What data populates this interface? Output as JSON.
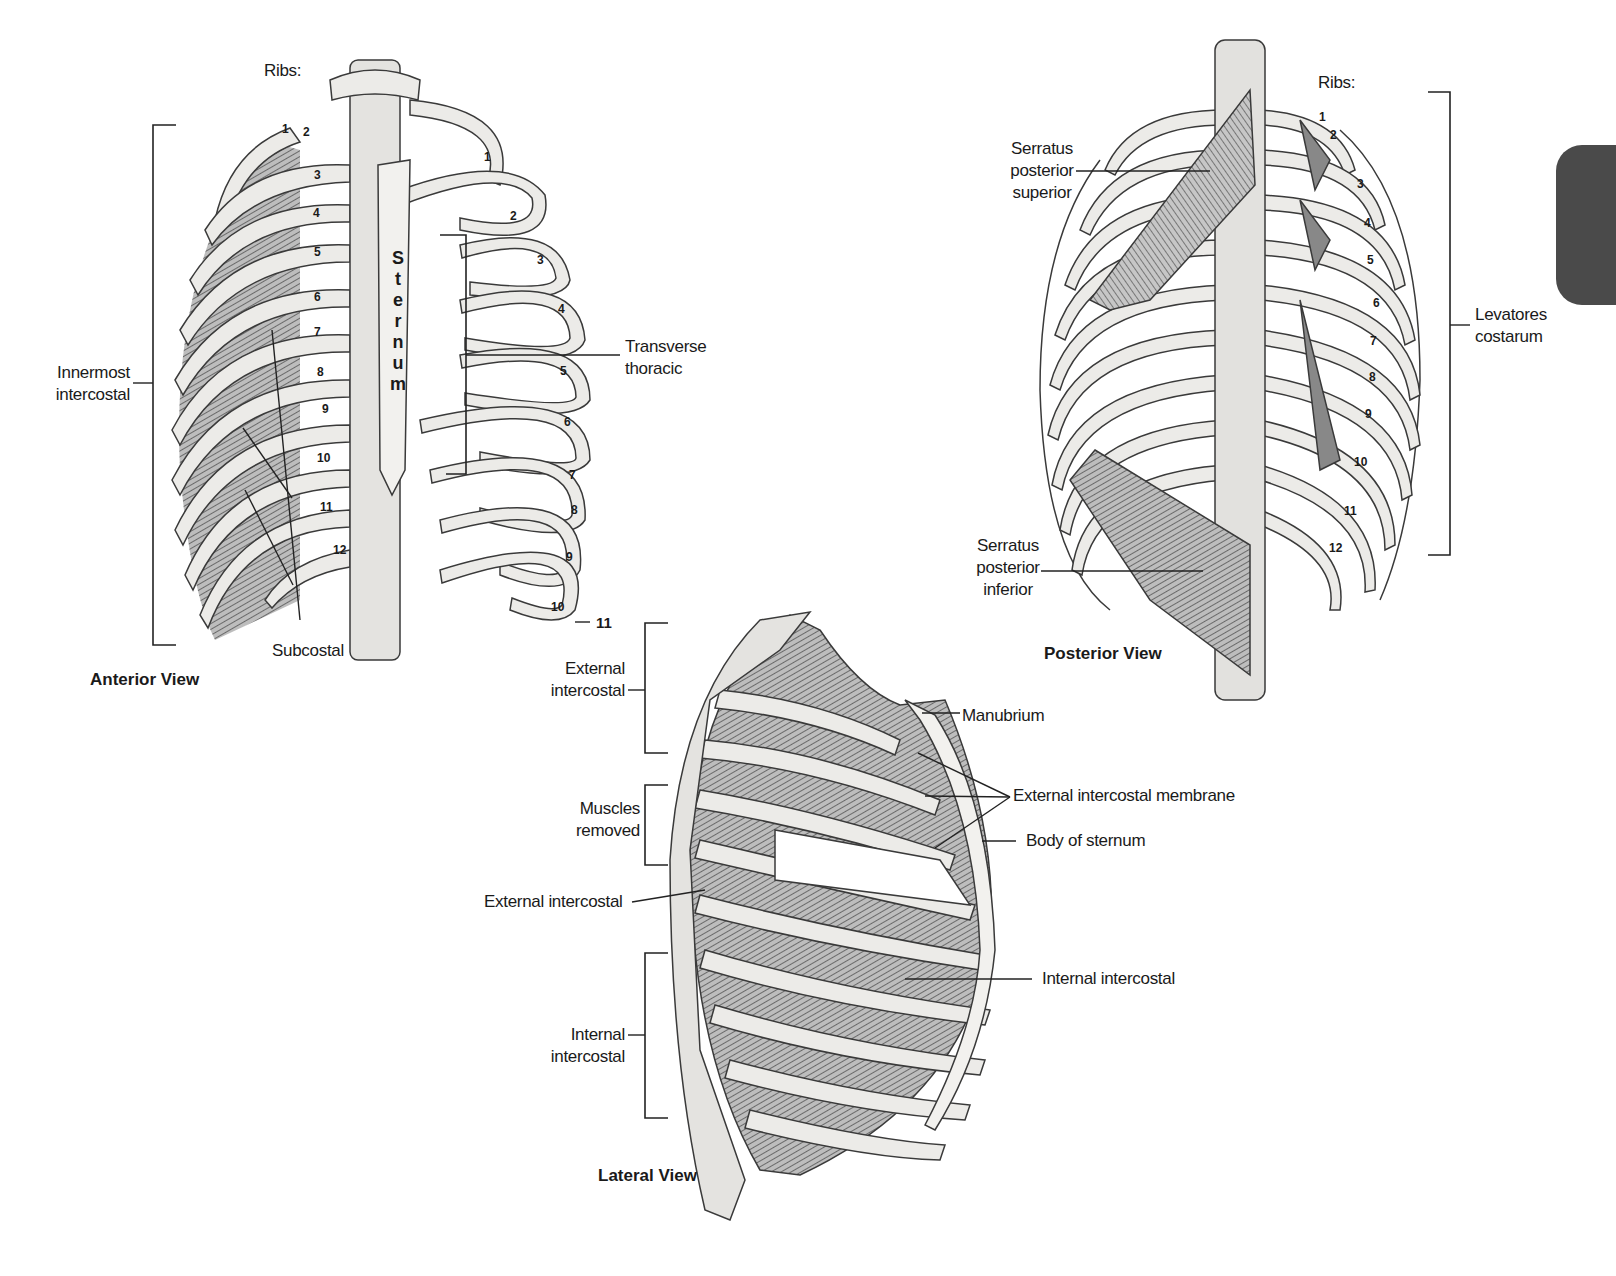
{
  "views": {
    "anterior": {
      "title": "Anterior View",
      "ribs_heading": "Ribs:",
      "sternum_label": "Sternum",
      "labels": {
        "innermost_intercostal": [
          "Innermost",
          "intercostal"
        ],
        "subcostal": "Subcostal",
        "transverse_thoracic": [
          "Transverse",
          "thoracic"
        ]
      },
      "rib_numbers_left": [
        "1",
        "2",
        "3",
        "4",
        "5",
        "6",
        "7",
        "8",
        "9",
        "10",
        "11",
        "12"
      ],
      "rib_numbers_right": [
        "1",
        "2",
        "3",
        "4",
        "5",
        "6",
        "7",
        "8",
        "9",
        "10",
        "11"
      ]
    },
    "posterior": {
      "title": "Posterior View",
      "ribs_heading": "Ribs:",
      "labels": {
        "serratus_posterior_superior": [
          "Serratus",
          "posterior",
          "superior"
        ],
        "serratus_posterior_inferior": [
          "Serratus",
          "posterior",
          "inferior"
        ],
        "levatores_costarum": [
          "Levatores",
          "costarum"
        ]
      },
      "rib_numbers": [
        "1",
        "2",
        "3",
        "4",
        "5",
        "6",
        "7",
        "8",
        "9",
        "10",
        "11",
        "12"
      ]
    },
    "lateral": {
      "title": "Lateral View",
      "labels": {
        "external_intercostal_bracket": [
          "External",
          "intercostal"
        ],
        "muscles_removed": [
          "Muscles",
          "removed"
        ],
        "external_intercostal": "External intercostal",
        "internal_intercostal_bracket": [
          "Internal",
          "intercostal"
        ],
        "manubrium": "Manubrium",
        "external_intercostal_membrane": "External intercostal membrane",
        "body_of_sternum": "Body of sternum",
        "internal_intercostal": "Internal intercostal"
      }
    }
  },
  "colors": {
    "bone_fill": "#ecebe8",
    "bone_stroke": "#3a3a3a",
    "muscle": "#6b6b6b",
    "section_tab": "#4a4a4a"
  }
}
